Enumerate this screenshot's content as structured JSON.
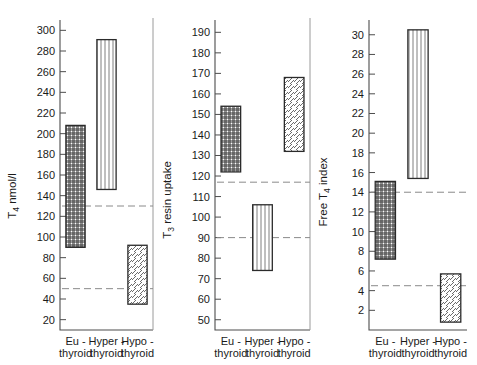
{
  "figure": {
    "background": "#ffffff",
    "ink_color": "#1a1a1a",
    "bar_outline_color": "#2b2b2b",
    "reference_line_color": "#8a8a8a"
  },
  "chart_data": [
    {
      "type": "bar",
      "title": "",
      "ylabel": "T4 nmol/l",
      "ylabel_main": "T",
      "ylabel_sub": "4",
      "ylabel_tail": " nmol/l",
      "xlabel": "",
      "ylim": [
        10,
        310
      ],
      "yticks": [
        20,
        40,
        60,
        80,
        100,
        120,
        140,
        160,
        180,
        200,
        220,
        240,
        260,
        280,
        300
      ],
      "ytick_labels": [
        "20",
        "40",
        "60",
        "80",
        "100",
        "120",
        "140",
        "160",
        "180",
        "200",
        "220",
        "240",
        "260",
        "280",
        "300"
      ],
      "grid": false,
      "categories": [
        "Eu-thyroid",
        "Hyper-thyroid",
        "Hypo-thyroid"
      ],
      "category_lines": [
        [
          "Eu -",
          "thyroid"
        ],
        [
          "Hyper -",
          "thyroid"
        ],
        [
          "Hypo -",
          "thyroid"
        ]
      ],
      "ranges": [
        {
          "category": "Eu-thyroid",
          "low": 90,
          "high": 208,
          "fill": "crosshatch"
        },
        {
          "category": "Hyper-thyroid",
          "low": 146,
          "high": 291,
          "fill": "vertical"
        },
        {
          "category": "Hypo-thyroid",
          "low": 35,
          "high": 92,
          "fill": "diagonal"
        }
      ],
      "reference_lines": [
        130,
        50
      ]
    },
    {
      "type": "bar",
      "title": "",
      "ylabel": "T3 resin uptake",
      "ylabel_main": "T",
      "ylabel_sub": "3",
      "ylabel_tail": " resin uptake",
      "xlabel": "",
      "ylim": [
        45,
        196
      ],
      "yticks": [
        50,
        60,
        70,
        80,
        90,
        100,
        110,
        120,
        130,
        140,
        150,
        160,
        170,
        180,
        190
      ],
      "ytick_labels": [
        "50",
        "60",
        "70",
        "80",
        "90",
        "100",
        "110",
        "120",
        "130",
        "140",
        "150",
        "160",
        "170",
        "180",
        "190"
      ],
      "grid": false,
      "categories": [
        "Eu-thyroid",
        "Hyper-thyroid",
        "Hypo-thyroid"
      ],
      "category_lines": [
        [
          "Eu -",
          "thyroid"
        ],
        [
          "Hyper -",
          "thyroid"
        ],
        [
          "Hypo -",
          "thyroid"
        ]
      ],
      "ranges": [
        {
          "category": "Eu-thyroid",
          "low": 122,
          "high": 154,
          "fill": "crosshatch"
        },
        {
          "category": "Hyper-thyroid",
          "low": 74,
          "high": 106,
          "fill": "vertical"
        },
        {
          "category": "Hypo-thyroid",
          "low": 132,
          "high": 168,
          "fill": "diagonal"
        }
      ],
      "reference_lines": [
        117,
        90
      ]
    },
    {
      "type": "bar",
      "title": "",
      "ylabel": "Free T4 index",
      "ylabel_main": "Free T",
      "ylabel_sub": "4",
      "ylabel_tail": " index",
      "xlabel": "",
      "ylim": [
        0,
        31.5
      ],
      "yticks": [
        2,
        4,
        6,
        8,
        10,
        12,
        14,
        16,
        18,
        20,
        22,
        24,
        26,
        28,
        30
      ],
      "ytick_labels": [
        "2",
        "4",
        "6",
        "8",
        "10",
        "12",
        "14",
        "16",
        "18",
        "20",
        "22",
        "24",
        "26",
        "28",
        "30"
      ],
      "grid": false,
      "categories": [
        "Eu-thyroid",
        "Hyper-thyroid",
        "Hypo-thyroid"
      ],
      "category_lines": [
        [
          "Eu -",
          "thyroid"
        ],
        [
          "Hyper -",
          "thyroid"
        ],
        [
          "Hypo -",
          "thyroid"
        ]
      ],
      "ranges": [
        {
          "category": "Eu-thyroid",
          "low": 7.2,
          "high": 15.1,
          "fill": "crosshatch"
        },
        {
          "category": "Hyper-thyroid",
          "low": 15.4,
          "high": 30.5,
          "fill": "vertical"
        },
        {
          "category": "Hypo-thyroid",
          "low": 0.8,
          "high": 5.7,
          "fill": "diagonal"
        }
      ],
      "reference_lines": [
        14.0,
        4.5
      ]
    }
  ]
}
